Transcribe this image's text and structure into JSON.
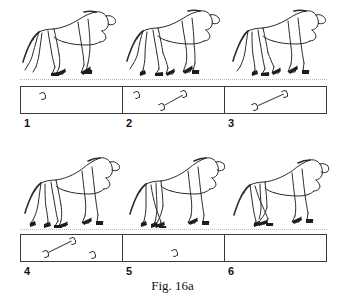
{
  "figure": {
    "caption": "Fig. 16a",
    "title_visible": "Fig. 16a",
    "rows": [
      {
        "name": "row-top",
        "frames": [
          {
            "number": "1",
            "horse": "horse-trot-right-frame-1",
            "prints": [
              {
                "name": "hoofprint-a",
                "x": 18,
                "y": 5
              },
              {
                "name": "hoofprint-b",
                "x": 0,
                "y": 0,
                "hidden": true
              }
            ],
            "links": []
          },
          {
            "number": "2",
            "horse": "horse-trot-right-frame-2",
            "prints": [
              {
                "name": "hoofprint-a",
                "x": 10,
                "y": 4
              },
              {
                "name": "hoofprint-b",
                "x": 57,
                "y": 3
              },
              {
                "name": "hoofprint-c",
                "x": 35,
                "y": 16
              }
            ],
            "links": [
              {
                "name": "diagonal-link",
                "x1": 41,
                "y1": 17,
                "x2": 59,
                "y2": 7
              }
            ]
          },
          {
            "number": "3",
            "horse": "horse-trot-right-frame-3",
            "prints": [
              {
                "name": "hoofprint-a",
                "x": 56,
                "y": 3
              },
              {
                "name": "hoofprint-b",
                "x": 26,
                "y": 16
              }
            ],
            "links": [
              {
                "name": "diagonal-link",
                "x1": 33,
                "y1": 17,
                "x2": 58,
                "y2": 7
              }
            ]
          }
        ]
      },
      {
        "name": "row-bottom",
        "frames": [
          {
            "number": "4",
            "horse": "horse-trot-right-frame-4",
            "prints": [
              {
                "name": "hoofprint-a",
                "x": 48,
                "y": 2
              },
              {
                "name": "hoofprint-b",
                "x": 21,
                "y": 15
              },
              {
                "name": "hoofprint-c",
                "x": 68,
                "y": 16
              }
            ],
            "links": [
              {
                "name": "diagonal-link",
                "x1": 27,
                "y1": 16,
                "x2": 50,
                "y2": 6
              }
            ]
          },
          {
            "number": "5",
            "horse": "horse-trot-right-frame-5",
            "prints": [
              {
                "name": "hoofprint-a",
                "x": 48,
                "y": 14
              }
            ],
            "links": []
          },
          {
            "number": "6",
            "horse": "horse-trot-right-frame-6",
            "prints": [],
            "links": []
          }
        ]
      }
    ]
  },
  "colors": {
    "ink": "#2b2b2b",
    "box_border": "#3a3a3a",
    "ground_line": "#b8b8b8",
    "paper": "#ffffff"
  }
}
